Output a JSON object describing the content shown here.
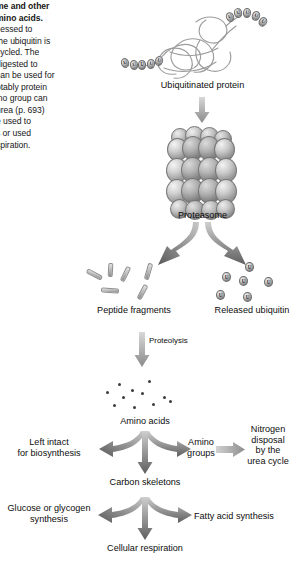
{
  "caption": {
    "lines": [
      {
        "text": "me and other",
        "bold": true
      },
      {
        "text": "mino acids.",
        "bold": true
      },
      {
        "text": "cessed to",
        "bold": false
      },
      {
        "text": " the ubiquitin is",
        "bold": false
      },
      {
        "text": "cycled. The",
        "bold": false
      },
      {
        "text": "digested to",
        "bold": false
      },
      {
        "text": "can be used for",
        "bold": false
      },
      {
        "text": "otably protein",
        "bold": false
      },
      {
        "text": "ino group can",
        "bold": false
      },
      {
        "text": " urea (p. 693)",
        "bold": false
      },
      {
        "text": "e used to",
        "bold": false
      },
      {
        "text": "s or used",
        "bold": false
      },
      {
        "text": "spiration.",
        "bold": false
      }
    ]
  },
  "diagram": {
    "title_ubiquitinated_protein": "Ubiquitinated protein",
    "label_proteasome": "Proteasome",
    "label_peptide_fragments": "Peptide fragments",
    "label_released_ubiquitin": "Released ubiquitin",
    "label_proteolysis": "Proteolysis",
    "label_amino_acids": "Amino acids",
    "label_left_intact": "Left intact\nfor biosynthesis",
    "label_amino_groups": "Amino\ngroups",
    "label_nitrogen_disposal": "Nitrogen\ndisposal\nby the\nurea cycle",
    "label_carbon_skeletons": "Carbon skeletons",
    "label_glucose_glycogen": "Glucose or glycogen\nsynthesis",
    "label_fatty_acid": "Fatty acid synthesis",
    "label_cellular_respiration": "Cellular respiration",
    "ubiquitin_glyph": "U"
  },
  "colors": {
    "text": "#0d0d0d",
    "arrow_dark": "#4f4f4f",
    "arrow_light": "#b9b9b9",
    "sphere_mid": "#9c9c9c",
    "background": "#ffffff"
  },
  "chart_data": {
    "type": "diagram",
    "nodes": [
      {
        "id": "ubiquitinated_protein",
        "label": "Ubiquitinated protein",
        "x": 205,
        "y": 50
      },
      {
        "id": "proteasome",
        "label": "Proteasome",
        "x": 202,
        "y": 165
      },
      {
        "id": "peptide_fragments",
        "label": "Peptide fragments",
        "x": 133,
        "y": 290
      },
      {
        "id": "released_ubiquitin",
        "label": "Released ubiquitin",
        "x": 252,
        "y": 290
      },
      {
        "id": "amino_acids",
        "label": "Amino acids",
        "x": 145,
        "y": 395
      },
      {
        "id": "left_intact",
        "label": "Left intact for biosynthesis",
        "x": 48,
        "y": 448
      },
      {
        "id": "amino_groups",
        "label": "Amino groups",
        "x": 200,
        "y": 448
      },
      {
        "id": "nitrogen_disposal",
        "label": "Nitrogen disposal by the urea cycle",
        "x": 264,
        "y": 448
      },
      {
        "id": "carbon_skeletons",
        "label": "Carbon skeletons",
        "x": 145,
        "y": 487
      },
      {
        "id": "glucose_glycogen",
        "label": "Glucose or glycogen synthesis",
        "x": 62,
        "y": 516
      },
      {
        "id": "fatty_acid",
        "label": "Fatty acid synthesis",
        "x": 225,
        "y": 520
      },
      {
        "id": "cellular_respiration",
        "label": "Cellular respiration",
        "x": 145,
        "y": 550
      }
    ],
    "edges": [
      {
        "from": "ubiquitinated_protein",
        "to": "proteasome",
        "label": ""
      },
      {
        "from": "proteasome",
        "to": "peptide_fragments",
        "label": ""
      },
      {
        "from": "proteasome",
        "to": "released_ubiquitin",
        "label": ""
      },
      {
        "from": "peptide_fragments",
        "to": "amino_acids",
        "label": "Proteolysis"
      },
      {
        "from": "amino_acids",
        "to": "left_intact",
        "label": ""
      },
      {
        "from": "amino_acids",
        "to": "carbon_skeletons",
        "label": ""
      },
      {
        "from": "amino_acids",
        "to": "amino_groups",
        "label": ""
      },
      {
        "from": "amino_groups",
        "to": "nitrogen_disposal",
        "label": ""
      },
      {
        "from": "carbon_skeletons",
        "to": "glucose_glycogen",
        "label": ""
      },
      {
        "from": "carbon_skeletons",
        "to": "cellular_respiration",
        "label": ""
      },
      {
        "from": "carbon_skeletons",
        "to": "fatty_acid",
        "label": ""
      }
    ],
    "counts": {
      "ubiquitin_beads_on_protein": 10,
      "released_ubiquitin_beads": 6,
      "peptide_fragment_rods": 6,
      "amino_acid_dots": 11
    }
  }
}
